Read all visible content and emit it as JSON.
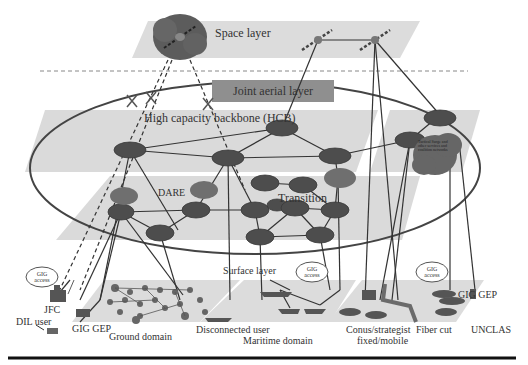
{
  "layers": {
    "space": "Space layer",
    "joint_aerial": "Joint aerial layer",
    "hcb": "High capacity backbone (HCB)",
    "dare": "DARE",
    "transition": "Transition",
    "surface": "Surface layer"
  },
  "clouds": {
    "gig_access": "GIG access",
    "coalition_cloud": "Tactical Surge and other services and coalition networks"
  },
  "labels": {
    "jfc": "JFC",
    "dil_user": "DIL user",
    "gig_gep_left": "GIG GEP",
    "ground_domain": "Ground domain",
    "disconnected_user": "Disconnected user",
    "maritime_domain": "Maritime domain",
    "conus_strategist": "Conus/strategist",
    "fixed_mobile": "fixed/mobile",
    "fiber_cut": "Fiber cut",
    "gig_gep_right": "GIG GEP",
    "unclas": "UNCLAS"
  },
  "colors": {
    "layer_fill": "#d9d9d9",
    "node_fill": "#4a4a4a",
    "link": "#333333",
    "joint_aerial_fill": "#8c8c8c",
    "cloud_fill": "#6a6a6a"
  }
}
